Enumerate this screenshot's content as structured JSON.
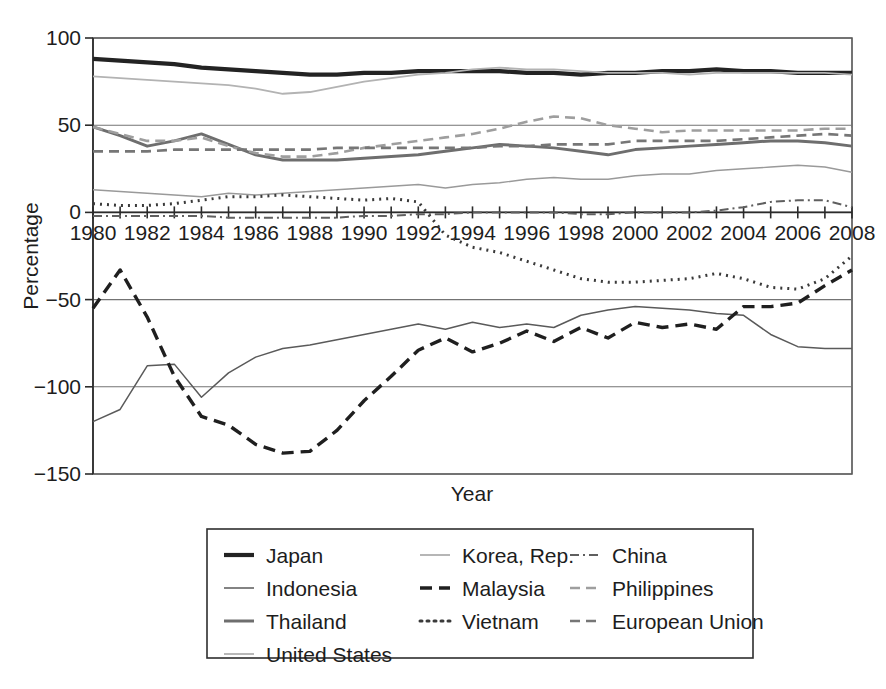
{
  "chart_data": {
    "type": "line",
    "title": "",
    "xlabel": "Year",
    "ylabel": "Percentage",
    "xlim": [
      1980,
      2008
    ],
    "ylim": [
      -150,
      100
    ],
    "yticks": [
      100,
      50,
      0,
      -50,
      -100,
      -150
    ],
    "ytick_labels": [
      "100",
      "50",
      "0",
      "−50",
      "−100",
      "−150"
    ],
    "xticks": [
      1980,
      1981,
      1982,
      1983,
      1984,
      1985,
      1986,
      1987,
      1988,
      1989,
      1990,
      1991,
      1992,
      1993,
      1994,
      1995,
      1996,
      1997,
      1998,
      1999,
      2000,
      2001,
      2002,
      2003,
      2004,
      2005,
      2006,
      2007,
      2008
    ],
    "xtick_labels_shown": [
      "1980",
      "1982",
      "1984",
      "1986",
      "1988",
      "1990",
      "1992",
      "1994",
      "1996",
      "1998",
      "2000",
      "2002",
      "2004",
      "2006",
      "2008"
    ],
    "grid": "horizontal-at-yticks",
    "legend_position": "below-plot",
    "legend_columns": 3,
    "x": [
      1980,
      1981,
      1982,
      1983,
      1984,
      1985,
      1986,
      1987,
      1988,
      1989,
      1990,
      1991,
      1992,
      1993,
      1994,
      1995,
      1996,
      1997,
      1998,
      1999,
      2000,
      2001,
      2002,
      2003,
      2004,
      2005,
      2006,
      2007,
      2008
    ],
    "series": [
      {
        "name": "Japan",
        "color": "#232323",
        "width": 4.2,
        "dash": "none",
        "values": [
          88,
          87,
          86,
          85,
          83,
          82,
          81,
          80,
          79,
          79,
          80,
          80,
          81,
          81,
          81,
          81,
          80,
          80,
          79,
          80,
          80,
          81,
          81,
          82,
          81,
          81,
          80,
          80,
          80
        ]
      },
      {
        "name": "Indonesia",
        "color": "#5a5a5a",
        "width": 1.5,
        "dash": "none",
        "values": [
          -120,
          -113,
          -88,
          -87,
          -106,
          -92,
          -83,
          -78,
          -76,
          -73,
          -70,
          -67,
          -64,
          -67,
          -63,
          -66,
          -64,
          -66,
          -59,
          -56,
          -54,
          -55,
          -56,
          -58,
          -59,
          -70,
          -77,
          -78,
          -78
        ]
      },
      {
        "name": "Thailand",
        "color": "#6e6e6e",
        "width": 3.0,
        "dash": "none",
        "values": [
          49,
          44,
          38,
          41,
          45,
          39,
          33,
          30,
          30,
          30,
          31,
          32,
          33,
          35,
          37,
          39,
          38,
          37,
          35,
          33,
          36,
          37,
          38,
          39,
          40,
          41,
          41,
          40,
          38
        ]
      },
      {
        "name": "United States",
        "color": "#9a9a9a",
        "width": 1.4,
        "dash": "none",
        "values": [
          13,
          12,
          11,
          10,
          9,
          11,
          10,
          11,
          12,
          13,
          14,
          15,
          16,
          14,
          16,
          17,
          19,
          20,
          19,
          19,
          21,
          22,
          22,
          24,
          25,
          26,
          27,
          26,
          23
        ]
      },
      {
        "name": "Korea, Rep.",
        "color": "#b3b3b3",
        "width": 1.9,
        "dash": "none",
        "values": [
          78,
          77,
          76,
          75,
          74,
          73,
          71,
          68,
          69,
          72,
          75,
          77,
          79,
          80,
          82,
          83,
          82,
          82,
          81,
          80,
          80,
          80,
          79,
          80,
          80,
          80,
          80,
          80,
          79
        ]
      },
      {
        "name": "Malaysia",
        "color": "#1f1f1f",
        "width": 3.4,
        "dash": "12,7",
        "values": [
          -55,
          -33,
          -60,
          -94,
          -117,
          -122,
          -133,
          -138,
          -137,
          -125,
          -108,
          -94,
          -79,
          -72,
          -80,
          -75,
          -68,
          -74,
          -66,
          -72,
          -63,
          -66,
          -64,
          -67,
          -54,
          -54,
          -52,
          -42,
          -33
        ]
      },
      {
        "name": "Vietnam",
        "color": "#3a3a3a",
        "width": 3.0,
        "dash": "2,5",
        "values": [
          5,
          4,
          4,
          5,
          7,
          9,
          9,
          10,
          9,
          8,
          7,
          8,
          6,
          -13,
          -20,
          -23,
          -28,
          -33,
          -38,
          -40,
          -40,
          -39,
          -38,
          -35,
          -38,
          -43,
          -44,
          -38,
          -25
        ]
      },
      {
        "name": "China",
        "color": "#5f5f5f",
        "width": 2.0,
        "dash": "9,4,2,4",
        "values": [
          -2,
          -2,
          -2,
          -2,
          -2,
          -3,
          -3,
          -3,
          -3,
          -3,
          -2,
          -2,
          -1,
          -1,
          0,
          0,
          0,
          0,
          -1,
          -1,
          0,
          0,
          0,
          1,
          3,
          6,
          7,
          7,
          3
        ]
      },
      {
        "name": "Philippines",
        "color": "#9e9e9e",
        "width": 2.6,
        "dash": "10,6",
        "values": [
          49,
          45,
          41,
          41,
          43,
          38,
          34,
          32,
          32,
          34,
          37,
          39,
          41,
          43,
          45,
          48,
          52,
          55,
          54,
          50,
          48,
          46,
          47,
          47,
          47,
          47,
          47,
          48,
          48
        ]
      },
      {
        "name": "European Union",
        "color": "#767676",
        "width": 2.6,
        "dash": "10,6",
        "values": [
          35,
          35,
          35,
          36,
          36,
          36,
          36,
          36,
          36,
          37,
          37,
          37,
          37,
          37,
          37,
          38,
          38,
          39,
          39,
          39,
          41,
          41,
          41,
          41,
          42,
          43,
          44,
          45,
          44
        ]
      }
    ]
  },
  "axes": {
    "ylabel": "Percentage",
    "xlabel": "Year",
    "ytick_labels": [
      "100",
      "50",
      "0",
      "−50",
      "−100",
      "−150"
    ],
    "xtick_labels": [
      "1980",
      "1982",
      "1984",
      "1986",
      "1988",
      "1990",
      "1992",
      "1994",
      "1996",
      "1998",
      "2000",
      "2002",
      "2004",
      "2006",
      "2008"
    ]
  },
  "legend": {
    "columns": [
      {
        "items": [
          {
            "label": "Japan",
            "style": "solid-thick-black"
          },
          {
            "label": "Indonesia",
            "style": "solid-thin-gray"
          },
          {
            "label": "Thailand",
            "style": "solid-medium-gray"
          },
          {
            "label": "United States",
            "style": "solid-thin-light"
          }
        ]
      },
      {
        "items": [
          {
            "label": "Korea, Rep.",
            "style": "solid-thin-light"
          },
          {
            "label": "Malaysia",
            "style": "dashed-black"
          },
          {
            "label": "Vietnam",
            "style": "dotted-dark"
          }
        ]
      },
      {
        "items": [
          {
            "label": "China",
            "style": "dash-dot-gray"
          },
          {
            "label": "Philippines",
            "style": "dashed-light"
          },
          {
            "label": "European Union",
            "style": "dashed-gray"
          }
        ]
      }
    ]
  }
}
